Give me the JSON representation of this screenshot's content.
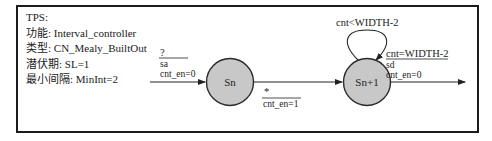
{
  "info": {
    "title": "TPS:",
    "function": "功能: Interval_controller",
    "type": "类型: CN_Mealy_BuiltOut",
    "latency": "潜伏期: SL=1",
    "min_interval": "最小间隔: MinInt=2"
  },
  "states": [
    {
      "name": "Sn",
      "fill": "#c8c8c8"
    },
    {
      "name": "Sn+1",
      "fill": "#c8c8c8"
    }
  ],
  "transitions": {
    "entry": {
      "condition": "?",
      "lines": [
        "sa",
        "cnt_en=0"
      ]
    },
    "sn_to_sn1": {
      "condition": "*",
      "lines": [
        "cnt_en=1"
      ]
    },
    "self_loop": {
      "condition": "cnt<WIDTH-2"
    },
    "exit": {
      "condition": "cnt=WIDTH-2",
      "lines": [
        "sd",
        "cnt_en=0"
      ]
    }
  }
}
